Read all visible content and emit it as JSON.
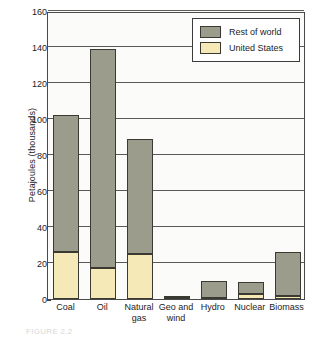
{
  "chart_data": {
    "type": "bar",
    "subtype": "stacked-bar",
    "title": "",
    "xlabel": "",
    "ylabel": "Petajoules (thousands)",
    "ylim": [
      0,
      160
    ],
    "ytick_step": 20,
    "yticks": [
      0,
      20,
      40,
      60,
      80,
      100,
      120,
      140,
      160
    ],
    "grid": true,
    "grid_axis": "y",
    "legend_position": "top-right",
    "categories": [
      "Coal",
      "Oil",
      "Natural gas",
      "Geo and wind",
      "Hydro",
      "Nuclear",
      "Biomass"
    ],
    "category_lines": [
      [
        "Coal"
      ],
      [
        "Oil"
      ],
      [
        "Natural",
        "gas"
      ],
      [
        "Geo and",
        "wind"
      ],
      [
        "Hydro"
      ],
      [
        "Nuclear"
      ],
      [
        "Biomass"
      ]
    ],
    "series": [
      {
        "name": "United States",
        "color": "#f5e9b8",
        "values": [
          26,
          17,
          25,
          0.6,
          0.5,
          3,
          1.5
        ]
      },
      {
        "name": "Rest of world",
        "color": "#9c9c8d",
        "values": [
          76,
          122,
          64,
          1,
          9.5,
          6.5,
          24.5
        ]
      }
    ],
    "totals": [
      102,
      139,
      89,
      1.6,
      10,
      9.5,
      26
    ]
  },
  "axes": {
    "y_title": "Petajoules (thousands)",
    "y_tick_labels": [
      "0",
      "20",
      "40",
      "60",
      "80",
      "100",
      "120",
      "140",
      "160"
    ],
    "x_tick_labels": [
      "Coal",
      "Oil",
      "Natural gas",
      "Geo and wind",
      "Hydro",
      "Nuclear",
      "Biomass"
    ]
  },
  "legend": {
    "items": [
      {
        "label": "Rest of world",
        "color": "#9c9c8d"
      },
      {
        "label": "United States",
        "color": "#f5e9b8"
      }
    ]
  },
  "caption": {
    "text": "FIGURE 2.2"
  },
  "colors": {
    "rest_of_world": "#9c9c8d",
    "united_states": "#f5e9b8",
    "axis": "#3c3c3c",
    "plot_background": "#fbfbfa",
    "page_background": "#ffffff"
  }
}
